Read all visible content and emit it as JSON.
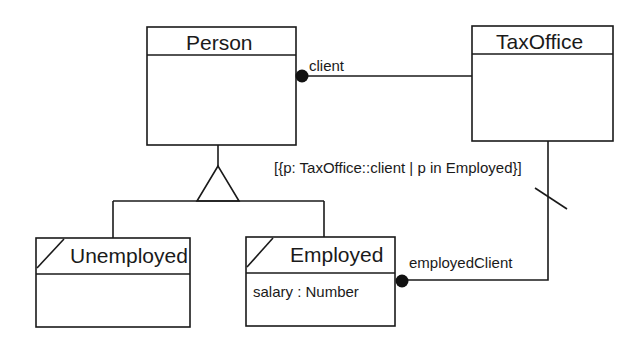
{
  "diagram": {
    "type": "UML class diagram",
    "classes": [
      {
        "id": "person",
        "name": "Person",
        "attributes": [],
        "abstract_marker": false
      },
      {
        "id": "taxoffice",
        "name": "TaxOffice",
        "attributes": [],
        "abstract_marker": false
      },
      {
        "id": "unemployed",
        "name": "Unemployed",
        "attributes": [],
        "derived_marker": true
      },
      {
        "id": "employed",
        "name": "Employed",
        "attributes": [
          "salary : Number"
        ],
        "derived_marker": true
      }
    ],
    "associations": [
      {
        "from": "TaxOffice",
        "to": "Person",
        "role": "client",
        "end_marker": "filled-circle"
      },
      {
        "from": "TaxOffice",
        "to": "Employed",
        "role": "employedClient",
        "end_marker": "filled-circle",
        "derived_slash": true
      }
    ],
    "generalization": {
      "parent": "Person",
      "children": [
        "Unemployed",
        "Employed"
      ]
    },
    "constraint": "[{p: TaxOffice::client | p in Employed}]"
  },
  "labels": {
    "person": "Person",
    "taxoffice": "TaxOffice",
    "unemployed": "Unemployed",
    "employed": "Employed",
    "employed_attr": "salary : Number",
    "client_role": "client",
    "employed_client_role": "employedClient",
    "constraint": "[{p: TaxOffice::client | p in Employed}]"
  },
  "colors": {
    "line": "#1a1a1a",
    "background": "#ffffff"
  }
}
